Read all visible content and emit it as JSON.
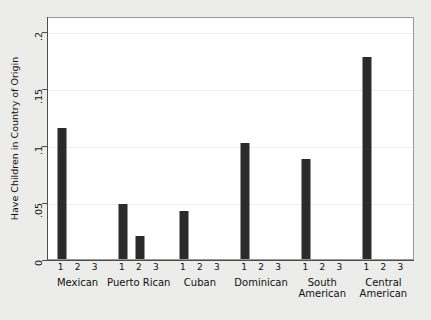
{
  "chart_data": {
    "type": "bar",
    "title": "",
    "xlabel": "",
    "ylabel": "Have Children in Country of Origin",
    "ylim": [
      0,
      0.2
    ],
    "yticks": [
      0,
      0.05,
      0.1,
      0.15,
      0.2
    ],
    "ytick_labels": [
      "0",
      ".05",
      ".1",
      ".15",
      ".2"
    ],
    "grid": true,
    "legend": "none",
    "group_labels": [
      "Mexican",
      "Puerto Rican",
      "Cuban",
      "Dominican",
      "South\nAmerican",
      "Central\nAmerican"
    ],
    "sub_labels": [
      "1",
      "2",
      "3"
    ],
    "groups": [
      {
        "name": "Mexican",
        "values": [
          0.115,
          0.0,
          0.0
        ]
      },
      {
        "name": "Puerto Rican",
        "values": [
          0.048,
          0.02,
          0.0
        ]
      },
      {
        "name": "Cuban",
        "values": [
          0.042,
          0.0,
          0.0
        ]
      },
      {
        "name": "Dominican",
        "values": [
          0.102,
          0.0,
          0.0
        ]
      },
      {
        "name": "South American",
        "values": [
          0.088,
          0.0,
          0.0
        ]
      },
      {
        "name": "Central American",
        "values": [
          0.177,
          0.0,
          0.0
        ]
      }
    ],
    "bar_color": "#2b2b2b",
    "plot_background": "#ffffff",
    "figure_background": "#ececeb",
    "gridline_color": "#ededed"
  }
}
